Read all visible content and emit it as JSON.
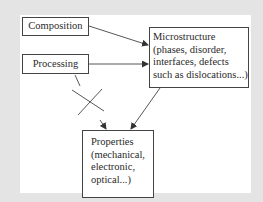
{
  "diagram": {
    "nodes": {
      "composition": {
        "label": "Composition"
      },
      "processing": {
        "label": "Processing"
      },
      "microstructure": {
        "lines": [
          "Microstructure",
          "(phases, disorder,",
          "interfaces, defects",
          "such as dislocations...)"
        ]
      },
      "properties": {
        "lines": [
          "Properties",
          "(mechanical,",
          "electronic,",
          "optical...)"
        ]
      }
    },
    "edges": [
      {
        "from": "composition",
        "to": "microstructure",
        "type": "arrow"
      },
      {
        "from": "processing",
        "to": "microstructure",
        "type": "arrow"
      },
      {
        "from": "microstructure",
        "to": "properties",
        "type": "arrow"
      },
      {
        "from": "processing",
        "to": "properties",
        "type": "crossed-out-arrow"
      }
    ],
    "colors": {
      "background": "#e4e4e4",
      "panel": "#ffffff",
      "stroke": "#444444"
    }
  }
}
